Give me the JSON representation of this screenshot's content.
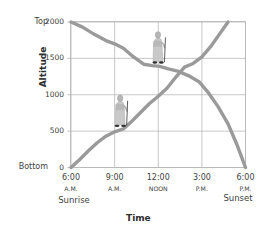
{
  "chart_data": {
    "type": "line",
    "title": "",
    "xlabel": "Time",
    "ylabel": "Altitude",
    "xlim": [
      6,
      18
    ],
    "ylim": [
      0,
      2000
    ],
    "grid": true,
    "legend": "none",
    "x_tick_times": [
      "6:00",
      "9:00",
      "12:00",
      "3:00",
      "6:00"
    ],
    "x_tick_periods": [
      "A.M.",
      "A.M.",
      "NOON",
      "P.M.",
      "P.M."
    ],
    "x_tick_hours": [
      6,
      9,
      12,
      15,
      18
    ],
    "x_endpoint_labels": {
      "start": "Sunrise",
      "end": "Sunset"
    },
    "y_tick_values": [
      0,
      500,
      1000,
      1500,
      2000
    ],
    "y_tick_labels": [
      "0",
      "500",
      "1000",
      "1500",
      "2000"
    ],
    "y_endpoint_labels": {
      "bottom": "Bottom",
      "top": "Top"
    },
    "line_color": "#9a9a9a",
    "grid_color": "#b9b9b9",
    "series": [
      {
        "name": "descent",
        "description": "Monk walking down from the top of the mountain",
        "x": [
          6.0,
          6.8,
          7.6,
          8.4,
          9.0,
          9.6,
          10.3,
          11.0,
          11.6,
          12.1,
          12.7,
          13.4,
          14.1,
          14.8,
          15.4,
          16.1,
          16.8,
          17.4,
          18.0
        ],
        "y": [
          2000,
          1930,
          1830,
          1745,
          1700,
          1640,
          1520,
          1420,
          1400,
          1390,
          1355,
          1320,
          1260,
          1180,
          1040,
          840,
          600,
          320,
          0
        ]
      },
      {
        "name": "ascent",
        "description": "Monk walking up the mountain",
        "x": [
          6.0,
          6.6,
          7.2,
          7.8,
          8.4,
          9.0,
          9.6,
          10.2,
          10.8,
          11.4,
          12.0,
          12.6,
          13.2,
          13.8,
          14.4,
          15.0,
          15.6,
          16.2,
          16.8
        ],
        "y": [
          0,
          110,
          230,
          340,
          430,
          490,
          530,
          640,
          760,
          880,
          980,
          1090,
          1240,
          1380,
          1430,
          1520,
          1660,
          1830,
          2000
        ]
      }
    ],
    "annotations": [
      {
        "name": "monk-upper",
        "icon": "monk-with-staff-icon",
        "x": 12.0,
        "y": 1430
      },
      {
        "name": "monk-lower",
        "icon": "monk-with-staff-icon",
        "x": 9.4,
        "y": 560
      }
    ]
  },
  "figure": {
    "y_axis_title": "Altitude",
    "x_axis_title": "Time"
  }
}
